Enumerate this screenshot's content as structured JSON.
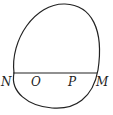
{
  "diagram": {
    "type": "closed-curve-with-chord",
    "stroke_color": "#222222",
    "background": "#ffffff",
    "points": [
      {
        "label": "N",
        "x": 6,
        "y": 82
      },
      {
        "label": "O",
        "x": 35,
        "y": 82
      },
      {
        "label": "P",
        "x": 72,
        "y": 82
      },
      {
        "label": "M",
        "x": 100,
        "y": 82
      }
    ],
    "chord": {
      "from": "N",
      "to": "M",
      "y": 73
    }
  }
}
